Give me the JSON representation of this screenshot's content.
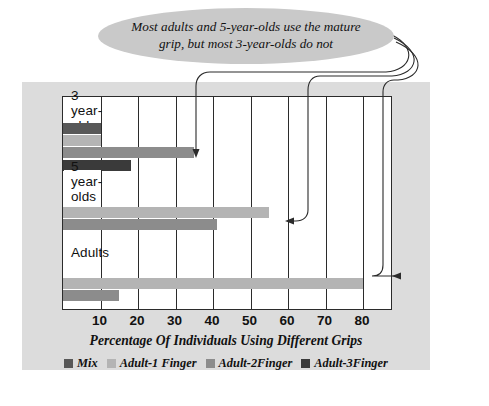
{
  "callout": {
    "text": "Most adults and 5-year-olds use the mature grip, but most 3-year-olds do not",
    "line1": "Most adults and 5-year-olds use the mature",
    "line2": "grip, but most 3-year-olds do not",
    "fill": "#c9c9c9"
  },
  "axis": {
    "title": "Percentage Of Individuals Using Different Grips",
    "ticks": [
      "10",
      "20",
      "30",
      "40",
      "50",
      "60",
      "70",
      "80"
    ],
    "tick_values": [
      10,
      20,
      30,
      40,
      50,
      60,
      70,
      80
    ],
    "min": 0,
    "max": 88
  },
  "legend": {
    "items": [
      {
        "label": "Mix",
        "color": "#585858"
      },
      {
        "label": "Adult-1 Finger",
        "color": "#b4b4b4"
      },
      {
        "label": "Adult-2Finger",
        "color": "#8c8c8c"
      },
      {
        "label": "Adult-3Finger",
        "color": "#3a3a3a"
      }
    ]
  },
  "groups": [
    {
      "label": "3 year-olds"
    },
    {
      "label": "5 year-olds"
    },
    {
      "label": "Adults"
    }
  ],
  "chart_data": {
    "type": "bar",
    "orientation": "horizontal",
    "title": "",
    "xlabel": "Percentage Of Individuals Using Different Grips",
    "ylabel": "",
    "xlim": [
      0,
      88
    ],
    "grid": true,
    "legend_position": "bottom",
    "categories": [
      "3 year-olds",
      "5 year-olds",
      "Adults"
    ],
    "series": [
      {
        "name": "Mix",
        "color": "#585858",
        "values": [
          10,
          0,
          0
        ]
      },
      {
        "name": "Adult-1 Finger",
        "color": "#b4b4b4",
        "values": [
          10,
          55,
          80
        ]
      },
      {
        "name": "Adult-2Finger",
        "color": "#8c8c8c",
        "values": [
          35,
          41,
          15
        ]
      },
      {
        "name": "Adult-3Finger",
        "color": "#3a3a3a",
        "values": [
          18,
          0,
          0
        ]
      }
    ],
    "annotations": [
      {
        "text": "Most adults and 5-year-olds use the mature grip, but most 3-year-olds do not",
        "points_to": [
          "3 year-olds / Adult-2Finger",
          "5 year-olds / Adult-1 Finger",
          "Adults / Adult-1 Finger"
        ]
      }
    ]
  },
  "colors": {
    "panel_background": "#dcdcdc",
    "plot_background": "#ffffff",
    "frame": "#2b2b2b",
    "page_background": "#ffffff"
  }
}
